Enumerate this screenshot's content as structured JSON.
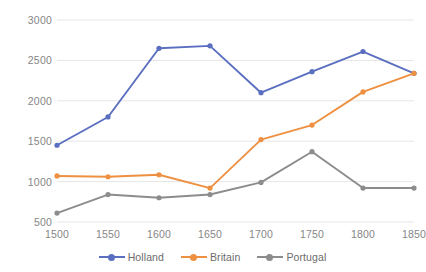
{
  "chart_data": {
    "type": "line",
    "title": "",
    "subtitle": "",
    "xlabel": "",
    "ylabel": "",
    "x": [
      1500,
      1550,
      1600,
      1650,
      1700,
      1750,
      1800,
      1850
    ],
    "categories": [
      "1500",
      "1550",
      "1600",
      "1650",
      "1700",
      "1750",
      "1800",
      "1850"
    ],
    "series": [
      {
        "name": "Holland",
        "color": "#5b6fc0",
        "values": [
          1450,
          1800,
          2650,
          2680,
          2100,
          2360,
          2610,
          2340
        ]
      },
      {
        "name": "Britain",
        "color": "#ed9042",
        "values": [
          1070,
          1060,
          1085,
          920,
          1520,
          1700,
          2110,
          2340
        ]
      },
      {
        "name": "Portugal",
        "color": "#8c8c8c",
        "values": [
          610,
          840,
          800,
          840,
          990,
          1370,
          920,
          920
        ]
      }
    ],
    "ylim": [
      500,
      3000
    ],
    "yticks": [
      500,
      1000,
      1500,
      2000,
      2500,
      3000
    ],
    "ytick_labels": [
      "500",
      "1000",
      "1500",
      "2000",
      "2500",
      "3000"
    ],
    "xlim": [
      1500,
      1850
    ],
    "grid": true,
    "grid_color": "#e6e6e6",
    "legend_position": "bottom",
    "marker": "circle",
    "background": "#ffffff"
  },
  "axis": {
    "y_labels": [
      "3000",
      "2500",
      "2000",
      "1500",
      "1000",
      "500"
    ],
    "x_labels": [
      "1500",
      "1550",
      "1600",
      "1650",
      "1700",
      "1750",
      "1800",
      "1850"
    ]
  },
  "legend": {
    "items": [
      {
        "label": "Holland",
        "color": "#5b6fc0"
      },
      {
        "label": "Britain",
        "color": "#ed9042"
      },
      {
        "label": "Portugal",
        "color": "#8c8c8c"
      }
    ]
  }
}
